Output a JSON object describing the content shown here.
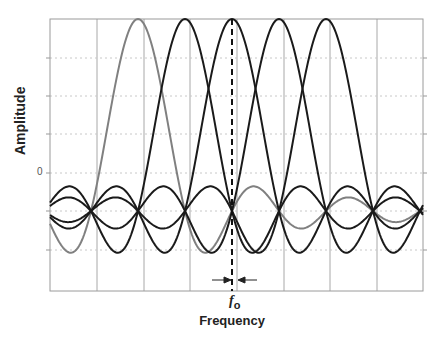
{
  "chart_data": {
    "type": "line",
    "title": "",
    "xlabel": "Frequency",
    "ylabel": "Amplitude",
    "y_tick_labels": [
      "0"
    ],
    "annotation": {
      "text": "f",
      "subscript": "o",
      "marker": "dashed vertical line with inward arrows at center subcarrier"
    },
    "grid": {
      "vertical": "solid",
      "horizontal": "dotted"
    },
    "x_range": [
      -4.5,
      3.4
    ],
    "series": [
      {
        "name": "subcarrier 1",
        "center": -2,
        "color": "#808080"
      },
      {
        "name": "subcarrier 2",
        "center": -1,
        "color": "#1a1a1a"
      },
      {
        "name": "subcarrier 3",
        "center": 0,
        "color": "#1a1a1a"
      },
      {
        "name": "subcarrier 4",
        "center": 1,
        "color": "#1a1a1a"
      },
      {
        "name": "subcarrier 5",
        "center": 2,
        "color": "#1a1a1a"
      }
    ],
    "function": "sinc(x - center)",
    "ylim": [
      -0.42,
      1.0
    ]
  },
  "labels": {
    "ylabel": "Amplitude",
    "xlabel": "Frequency",
    "fo_main": "f",
    "fo_sub": "o",
    "zero": "0"
  }
}
